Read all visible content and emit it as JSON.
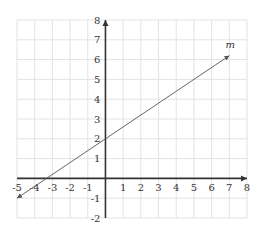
{
  "chart_data": {
    "type": "line",
    "title": "",
    "xlabel": "",
    "ylabel": "",
    "xlim": [
      -5,
      8
    ],
    "ylim": [
      -2,
      8
    ],
    "grid": true,
    "x_ticks": [
      "-5",
      "-4",
      "-3",
      "-2",
      "-1",
      "1",
      "2",
      "3",
      "4",
      "5",
      "6",
      "7",
      "8"
    ],
    "y_ticks": [
      "-2",
      "-1",
      "1",
      "2",
      "3",
      "4",
      "5",
      "6",
      "7",
      "8"
    ],
    "series": [
      {
        "name": "m",
        "slope": 0.6,
        "intercept": 2,
        "x": [
          -5,
          7
        ],
        "y": [
          -1,
          6.2
        ],
        "arrows": "both"
      }
    ],
    "annotations": [
      {
        "text": "m",
        "x": 7,
        "y": 6.5
      }
    ]
  }
}
